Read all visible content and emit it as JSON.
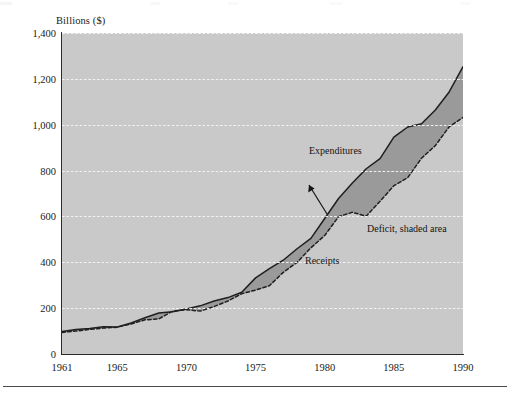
{
  "figure": {
    "axis_title": "Billions ($)",
    "background_color": "#ffffff",
    "plot_background_color": "#c9c9c9",
    "deficit_fill_color": "#9a9a9a",
    "line_color": "#1f1f1f",
    "gridline_color": "#f2f2f2"
  },
  "annotations": {
    "expenditures": "Expenditures",
    "deficit": "Deficit, shaded area",
    "receipts": "Receipts"
  },
  "chart_data": {
    "type": "area",
    "title": "",
    "subtitle": "",
    "xlabel": "",
    "ylabel": "Billions ($)",
    "xlim": [
      1961,
      1990
    ],
    "ylim": [
      0,
      1400
    ],
    "grid": true,
    "legend_position": "inline-annotations",
    "ytick_labels": [
      "0",
      "200",
      "400",
      "600",
      "800",
      "1,000",
      "1,200",
      "1,400"
    ],
    "ytick_values": [
      0,
      200,
      400,
      600,
      800,
      1000,
      1200,
      1400
    ],
    "xtick_labels": [
      "1961",
      "1965",
      "1970",
      "1975",
      "1980",
      "1985",
      "1990"
    ],
    "xtick_values": [
      1961,
      1965,
      1970,
      1975,
      1980,
      1985,
      1990
    ],
    "x": [
      1961,
      1962,
      1963,
      1964,
      1965,
      1966,
      1967,
      1968,
      1969,
      1970,
      1971,
      1972,
      1973,
      1974,
      1975,
      1976,
      1977,
      1978,
      1979,
      1980,
      1981,
      1982,
      1983,
      1984,
      1985,
      1986,
      1987,
      1988,
      1989,
      1990
    ],
    "series": [
      {
        "name": "Expenditures",
        "style": "solid",
        "values": [
          98,
          107,
          111,
          119,
          118,
          135,
          158,
          179,
          184,
          196,
          210,
          231,
          246,
          269,
          332,
          372,
          409,
          459,
          504,
          591,
          678,
          746,
          808,
          852,
          946,
          990,
          1004,
          1064,
          1143,
          1253
        ]
      },
      {
        "name": "Receipts",
        "style": "dashed",
        "values": [
          94,
          100,
          107,
          113,
          117,
          131,
          149,
          153,
          187,
          193,
          187,
          207,
          231,
          263,
          279,
          298,
          356,
          400,
          463,
          517,
          599,
          618,
          601,
          666,
          734,
          769,
          854,
          909,
          991,
          1032
        ]
      }
    ],
    "shaded_between": {
      "upper": "Expenditures",
      "lower": "Receipts",
      "label": "Deficit, shaded area",
      "color": "#9a9a9a"
    }
  }
}
